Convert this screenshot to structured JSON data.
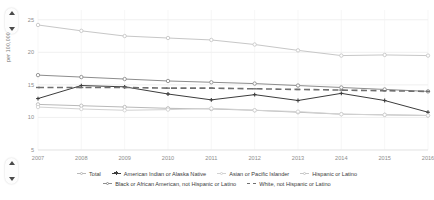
{
  "controls": {
    "scroll_up_top": "scroll-up",
    "scroll_down_top": "scroll-down",
    "scroll_up_bottom": "scroll-up",
    "scroll_down_bottom": "scroll-down"
  },
  "chart_data": {
    "type": "line",
    "title": "",
    "xlabel": "",
    "ylabel": "per 100,000",
    "x": [
      2007,
      2008,
      2009,
      2010,
      2011,
      2012,
      2013,
      2014,
      2015,
      2016
    ],
    "xtick_labels": [
      "2007",
      "2008",
      "2009",
      "2010",
      "2011",
      "2012",
      "2013",
      "2014",
      "2015",
      "2016"
    ],
    "ytick_labels": [
      "25",
      "20",
      "15",
      "10",
      "5"
    ],
    "ytick_values": [
      25,
      20,
      15,
      10,
      5
    ],
    "ylim": [
      5,
      26.5
    ],
    "grid": true,
    "legend_position": "bottom",
    "series": [
      {
        "name": "Total",
        "marker": "circle-open",
        "line": "solid",
        "color": "#b9b9b9",
        "values": [
          12.0,
          11.8,
          11.6,
          11.4,
          11.3,
          11.1,
          10.8,
          10.5,
          10.4,
          10.3
        ]
      },
      {
        "name": "American Indian or Alaska Native",
        "marker": "plus",
        "line": "solid",
        "color": "#3c3c3c",
        "values": [
          12.9,
          14.9,
          14.7,
          13.6,
          12.7,
          13.5,
          12.6,
          13.7,
          12.6,
          10.8
        ]
      },
      {
        "name": "Asian or Pacific Islander",
        "marker": "circle-open",
        "line": "solid",
        "color": "#d2d2d2",
        "values": [
          11.6,
          11.3,
          11.1,
          11.2,
          11.4,
          11.1,
          10.9,
          10.5,
          10.4,
          10.3
        ]
      },
      {
        "name": "Hispanic or Latino",
        "marker": "circle-open",
        "line": "solid",
        "color": "#c7c7c7",
        "values": [
          24.2,
          23.3,
          22.5,
          22.2,
          21.9,
          21.2,
          20.3,
          19.5,
          19.6,
          19.5
        ]
      },
      {
        "name": "Black or African American, not Hispanic or Latino",
        "marker": "circle-open",
        "line": "solid",
        "color": "#8d8d8d",
        "values": [
          16.5,
          16.2,
          15.9,
          15.6,
          15.4,
          15.2,
          14.9,
          14.6,
          14.3,
          14.0
        ]
      },
      {
        "name": "White, not Hispanic or Latino",
        "marker": "dash",
        "line": "dashed",
        "color": "#6f6f6f",
        "values": [
          14.6,
          14.6,
          14.6,
          14.5,
          14.5,
          14.4,
          14.3,
          14.2,
          14.1,
          14.0
        ]
      }
    ]
  }
}
